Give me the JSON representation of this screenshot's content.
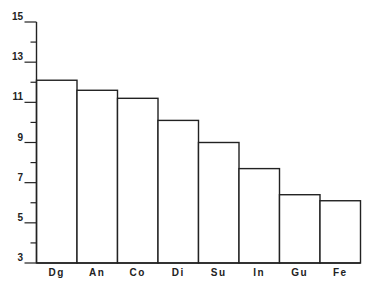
{
  "chart_data": {
    "type": "bar",
    "title": "",
    "xlabel": "",
    "ylabel": "",
    "categories": [
      "Dg",
      "An",
      "Co",
      "Di",
      "Su",
      "In",
      "Gu",
      "Fe"
    ],
    "values": [
      12.1,
      11.6,
      11.2,
      10.1,
      9.0,
      7.7,
      6.4,
      6.1
    ],
    "ylim": [
      3,
      15
    ],
    "y_major_ticks": [
      3,
      5,
      7,
      9,
      11,
      13,
      15
    ],
    "y_minor_ticks": [
      4,
      6,
      8,
      10,
      12,
      14
    ],
    "y_tick_labels": [
      "3",
      "5",
      "7",
      "9",
      "11",
      "13",
      "15"
    ],
    "grid": false,
    "legend": "none",
    "colors": {
      "bar_fill": "#ffffff",
      "stroke": "#222222"
    }
  }
}
